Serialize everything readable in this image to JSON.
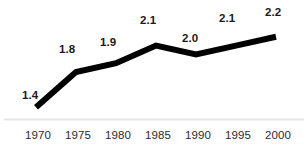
{
  "chart_data": {
    "type": "line",
    "title": "",
    "subtitle": "",
    "xlabel": "",
    "ylabel": "",
    "categories": [
      "1970",
      "1975",
      "1980",
      "1985",
      "1990",
      "1995",
      "2000"
    ],
    "values": [
      1.4,
      1.8,
      1.9,
      2.1,
      2.0,
      2.1,
      2.2
    ],
    "point_labels": [
      "1.4",
      "1.8",
      "1.9",
      "2.1",
      "2.0",
      "2.1",
      "2.2"
    ],
    "series": [
      {
        "name": "",
        "values": [
          1.4,
          1.8,
          1.9,
          2.1,
          2.0,
          2.1,
          2.2
        ]
      }
    ],
    "xlim": [
      "1970",
      "2000"
    ],
    "ylim": [
      1.3,
      2.3
    ],
    "grid": false,
    "legend": false,
    "legend_position": "none",
    "markers": false,
    "line_color": "#000000",
    "line_width": 6,
    "axis_color": "#e6e6e6",
    "label_color": "#1a1a1a",
    "tick_color": "#2b2b2b",
    "background_color": "#ffffff"
  },
  "labels": {
    "p0": "1.4",
    "p1": "1.8",
    "p2": "1.9",
    "p3": "2.1",
    "p4": "2.0",
    "p5": "2.1",
    "p6": "2.2"
  },
  "ticks": {
    "t0": "1970",
    "t1": "1975",
    "t2": "1980",
    "t3": "1985",
    "t4": "1990",
    "t5": "1995",
    "t6": "2000"
  }
}
